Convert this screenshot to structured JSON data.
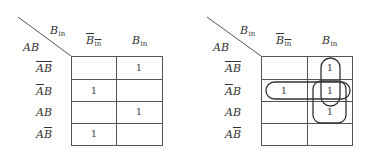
{
  "maps": [
    {
      "id": "left",
      "corner": {
        "col_var": "B",
        "col_var_sub": "in",
        "row_var": "AB"
      },
      "columns": [
        {
          "var": "B",
          "sub": "in",
          "negated": true
        },
        {
          "var": "B",
          "sub": "in",
          "negated": false
        }
      ],
      "rows": [
        {
          "parts": [
            {
              "t": "A",
              "neg": true
            },
            {
              "t": "B",
              "neg": true
            }
          ]
        },
        {
          "parts": [
            {
              "t": "A",
              "neg": true
            },
            {
              "t": "B",
              "neg": false
            }
          ]
        },
        {
          "parts": [
            {
              "t": "A",
              "neg": false
            },
            {
              "t": "B",
              "neg": false
            }
          ]
        },
        {
          "parts": [
            {
              "t": "A",
              "neg": false
            },
            {
              "t": "B",
              "neg": true
            }
          ]
        }
      ],
      "cells": [
        [
          "",
          "1"
        ],
        [
          "1",
          ""
        ],
        [
          "",
          "1"
        ],
        [
          "1",
          ""
        ]
      ],
      "groups": []
    },
    {
      "id": "right",
      "corner": {
        "col_var": "B",
        "col_var_sub": "in",
        "row_var": "AB"
      },
      "columns": [
        {
          "var": "B",
          "sub": "in",
          "negated": true
        },
        {
          "var": "B",
          "sub": "in",
          "negated": false
        }
      ],
      "rows": [
        {
          "parts": [
            {
              "t": "A",
              "neg": true
            },
            {
              "t": "B",
              "neg": true
            }
          ]
        },
        {
          "parts": [
            {
              "t": "A",
              "neg": true
            },
            {
              "t": "B",
              "neg": false
            }
          ]
        },
        {
          "parts": [
            {
              "t": "A",
              "neg": false
            },
            {
              "t": "B",
              "neg": false
            }
          ]
        },
        {
          "parts": [
            {
              "t": "A",
              "neg": false
            },
            {
              "t": "B",
              "neg": true
            }
          ]
        }
      ],
      "cells": [
        [
          "",
          "1"
        ],
        [
          "1",
          "1"
        ],
        [
          "",
          "1"
        ],
        [
          "",
          ""
        ]
      ],
      "groups": [
        {
          "name": "group-vertical-rows-1-2-col-2",
          "cells": [
            [
              0,
              1
            ],
            [
              1,
              1
            ]
          ]
        },
        {
          "name": "group-horizontal-row-2",
          "cells": [
            [
              1,
              0
            ],
            [
              1,
              1
            ]
          ]
        },
        {
          "name": "group-vertical-rows-2-3-col-2",
          "cells": [
            [
              1,
              1
            ],
            [
              2,
              1
            ]
          ]
        }
      ]
    }
  ],
  "colors": {
    "grid": "#555555",
    "text": "#333333",
    "loop": "#333333",
    "background": "#ffffff"
  }
}
